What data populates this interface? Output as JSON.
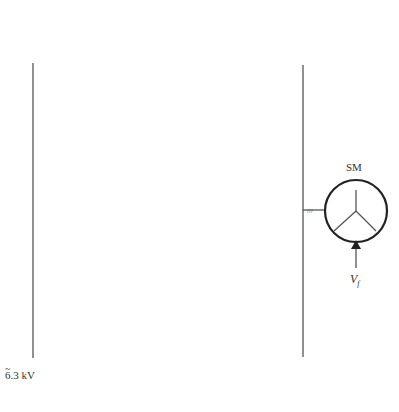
{
  "diagram": {
    "bus_label": "6.3 kV",
    "bus_label_tilde": "~",
    "bridge_label_line1": "Three-level",
    "bridge_label_line2": "bridge",
    "inductor_label": "L",
    "inductor_sub": "f",
    "dc_symbol": "=",
    "ac_symbol": "~",
    "machine": {
      "label": "SM",
      "excitation_label": "V",
      "excitation_sub": "f"
    },
    "branches": [
      {
        "transformer_label": "6.3/5 kV, 0°",
        "current_label": "I",
        "current_sub": "1",
        "y": 50
      },
      {
        "transformer_label": "6.3/5 kV, 15°",
        "current_label": "I",
        "current_sub": "2",
        "y": 160
      },
      {
        "transformer_label": "6.3/5 kV, 30°",
        "current_label": "I",
        "current_sub": "3",
        "y": 262
      },
      {
        "transformer_label": "6.3/5 kV, 45°",
        "current_label": "I",
        "current_sub": "4",
        "y": 357
      }
    ],
    "colors": {
      "line": "#555555",
      "text": "#333333",
      "background": "#ffffff"
    }
  }
}
